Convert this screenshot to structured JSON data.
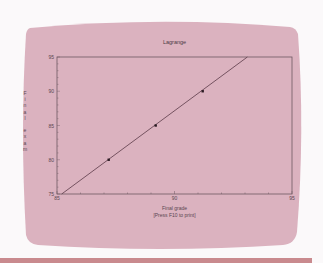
{
  "colors": {
    "screen": "#dbb2bf",
    "axis": "#6e5862",
    "line": "#5a3a48",
    "point": "#2a1a22",
    "strip": "#c98a8e"
  },
  "chart_data": {
    "type": "line",
    "title": "Lagrange",
    "xlabel": "Final grade",
    "ylabel": "Final exam",
    "footer": "[Press F10 to print]",
    "xlim": [
      85,
      95
    ],
    "ylim": [
      75,
      95
    ],
    "x_ticks": [
      "85",
      "90",
      "95"
    ],
    "y_ticks": [
      "75",
      "80",
      "85",
      "90",
      "95"
    ],
    "grid": false,
    "legend": null,
    "series": [
      {
        "name": "points",
        "type": "scatter",
        "x": [
          87.2,
          89.2,
          91.2
        ],
        "y": [
          80,
          85,
          90
        ]
      },
      {
        "name": "Lagrange interpolation",
        "type": "line",
        "x": [
          85.2,
          93.1
        ],
        "y": [
          75,
          95
        ]
      }
    ]
  },
  "chart": {
    "title": "Lagrange",
    "ylabel_chars": [
      "F",
      "i",
      "n",
      "a",
      "l",
      " ",
      "e",
      "x",
      "a",
      "m"
    ],
    "xlabel": "Final grade",
    "footer": "[Press F10 to print]",
    "x_ticks": [
      {
        "label": "85",
        "v": 85
      },
      {
        "label": "90",
        "v": 90
      },
      {
        "label": "95",
        "v": 95
      }
    ],
    "y_ticks": [
      {
        "label": "75",
        "v": 75
      },
      {
        "label": "80",
        "v": 80
      },
      {
        "label": "85",
        "v": 85
      },
      {
        "label": "90",
        "v": 90
      },
      {
        "label": "95",
        "v": 95
      }
    ]
  }
}
